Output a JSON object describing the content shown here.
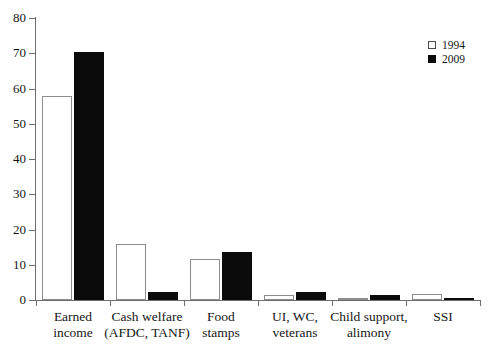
{
  "chart_data": {
    "type": "bar",
    "title": "",
    "subtitle": "",
    "xlabel": "",
    "ylabel": "",
    "ylim": [
      0,
      80
    ],
    "ytick_step": 10,
    "yticks": [
      "0",
      "10",
      "20",
      "30",
      "40",
      "50",
      "60",
      "70",
      "80"
    ],
    "grid": false,
    "legend_position": "top-right",
    "categories": [
      "Earned income",
      "Cash welfare (AFDC, TANF)",
      "Food stamps",
      "UI, WC, veterans",
      "Child support, alimony",
      "SSI"
    ],
    "category_label_lines": [
      [
        "Earned",
        "income"
      ],
      [
        "Cash welfare",
        "(AFDC, TANF)"
      ],
      [
        "Food",
        "stamps"
      ],
      [
        "UI, WC,",
        "veterans"
      ],
      [
        "Child support,",
        "alimony"
      ],
      [
        "SSI",
        ""
      ]
    ],
    "series": [
      {
        "name": "1994",
        "color": "#ffffff",
        "edge_color": "#8d8d8d",
        "values": [
          57.8,
          15.8,
          11.5,
          1.4,
          0.3,
          1.6
        ]
      },
      {
        "name": "2009",
        "color": "#0b0b0b",
        "edge_color": "#0b0b0b",
        "values": [
          70.5,
          2.3,
          13.5,
          2.2,
          1.5,
          0.7
        ]
      }
    ]
  },
  "legend": {
    "items": [
      {
        "label": "1994",
        "swatch": "hollow-square-icon"
      },
      {
        "label": "2009",
        "swatch": "filled-square-icon"
      }
    ]
  }
}
